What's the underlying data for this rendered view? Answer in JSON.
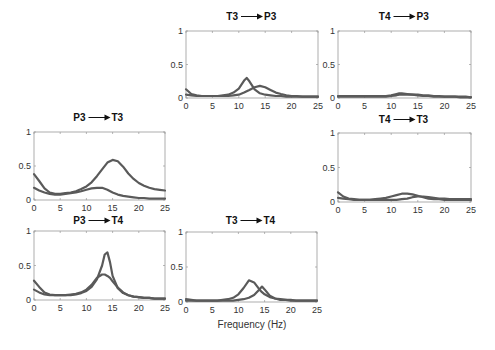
{
  "figure": {
    "xlabel": "Frequency (Hz)",
    "line_color": "#5a5a5a",
    "axis_color": "#9a9a9a"
  },
  "chart_data": [
    {
      "type": "line",
      "title": "T3 → P3",
      "title_from": "T3",
      "title_to": "P3",
      "xlabel": "",
      "ylabel": "",
      "xlim": [
        0,
        25
      ],
      "ylim": [
        0,
        1
      ],
      "xticks": [
        0,
        5,
        10,
        15,
        20,
        25
      ],
      "yticks": [
        0,
        0.5,
        1
      ],
      "x": [
        0,
        1,
        2,
        3,
        4,
        5,
        6,
        7,
        8,
        9,
        10,
        11,
        11.5,
        12,
        13,
        14,
        15,
        16,
        17,
        18,
        19,
        20,
        21,
        22,
        23,
        24,
        25
      ],
      "series": [
        {
          "name": "curve-1",
          "values": [
            0.13,
            0.06,
            0.04,
            0.03,
            0.03,
            0.03,
            0.03,
            0.04,
            0.05,
            0.08,
            0.14,
            0.26,
            0.3,
            0.25,
            0.13,
            0.07,
            0.05,
            0.04,
            0.03,
            0.03,
            0.02,
            0.02,
            0.02,
            0.02,
            0.02,
            0.02,
            0.02
          ]
        },
        {
          "name": "curve-2",
          "values": [
            0.05,
            0.04,
            0.03,
            0.03,
            0.03,
            0.03,
            0.03,
            0.03,
            0.03,
            0.04,
            0.05,
            0.08,
            0.1,
            0.12,
            0.16,
            0.18,
            0.16,
            0.12,
            0.08,
            0.06,
            0.04,
            0.03,
            0.03,
            0.02,
            0.02,
            0.02,
            0.02
          ]
        }
      ]
    },
    {
      "type": "line",
      "title": "T4 → P3",
      "title_from": "T4",
      "title_to": "P3",
      "xlabel": "",
      "ylabel": "",
      "xlim": [
        0,
        25
      ],
      "ylim": [
        0,
        1
      ],
      "xticks": [
        0,
        5,
        10,
        15,
        20,
        25
      ],
      "yticks": [
        0,
        0.5,
        1
      ],
      "x": [
        0,
        1,
        2,
        3,
        4,
        5,
        6,
        7,
        8,
        9,
        10,
        11,
        11.5,
        12,
        13,
        14,
        15,
        16,
        17,
        18,
        19,
        20,
        21,
        22,
        23,
        24,
        25
      ],
      "series": [
        {
          "name": "curve-1",
          "values": [
            0.03,
            0.03,
            0.03,
            0.03,
            0.03,
            0.03,
            0.03,
            0.03,
            0.03,
            0.03,
            0.04,
            0.06,
            0.07,
            0.07,
            0.06,
            0.05,
            0.04,
            0.03,
            0.03,
            0.02,
            0.02,
            0.02,
            0.02,
            0.02,
            0.01,
            0.01,
            0.01
          ]
        },
        {
          "name": "curve-2",
          "values": [
            0.02,
            0.02,
            0.02,
            0.02,
            0.02,
            0.02,
            0.02,
            0.02,
            0.02,
            0.02,
            0.03,
            0.04,
            0.05,
            0.05,
            0.05,
            0.05,
            0.05,
            0.04,
            0.04,
            0.03,
            0.03,
            0.02,
            0.02,
            0.02,
            0.02,
            0.02,
            0.01
          ]
        }
      ]
    },
    {
      "type": "line",
      "title": "P3 → T3",
      "title_from": "P3",
      "title_to": "T3",
      "xlabel": "",
      "ylabel": "",
      "xlim": [
        0,
        25
      ],
      "ylim": [
        0,
        1
      ],
      "xticks": [
        0,
        5,
        10,
        15,
        20,
        25
      ],
      "yticks": [
        0,
        0.5,
        1
      ],
      "x": [
        0,
        1,
        2,
        3,
        4,
        5,
        6,
        7,
        8,
        9,
        10,
        11,
        12,
        13,
        14,
        15,
        16,
        17,
        18,
        19,
        20,
        21,
        22,
        23,
        24,
        25
      ],
      "series": [
        {
          "name": "curve-1",
          "values": [
            0.38,
            0.28,
            0.17,
            0.11,
            0.09,
            0.09,
            0.1,
            0.11,
            0.13,
            0.16,
            0.2,
            0.26,
            0.35,
            0.45,
            0.55,
            0.59,
            0.57,
            0.49,
            0.39,
            0.31,
            0.25,
            0.21,
            0.18,
            0.16,
            0.15,
            0.14
          ]
        },
        {
          "name": "curve-2",
          "values": [
            0.18,
            0.14,
            0.11,
            0.09,
            0.08,
            0.08,
            0.09,
            0.1,
            0.11,
            0.13,
            0.15,
            0.17,
            0.18,
            0.18,
            0.15,
            0.11,
            0.08,
            0.06,
            0.05,
            0.04,
            0.03,
            0.03,
            0.02,
            0.02,
            0.02,
            0.02
          ]
        }
      ]
    },
    {
      "type": "line",
      "title": "T4 → T3",
      "title_from": "T4",
      "title_to": "T3",
      "xlabel": "",
      "ylabel": "",
      "xlim": [
        0,
        25
      ],
      "ylim": [
        0,
        1
      ],
      "xticks": [
        0,
        5,
        10,
        15,
        20,
        25
      ],
      "yticks": [
        0,
        0.5,
        1
      ],
      "x": [
        0,
        1,
        2,
        3,
        4,
        5,
        6,
        7,
        8,
        9,
        10,
        11,
        12,
        13,
        14,
        15,
        16,
        17,
        18,
        19,
        20,
        21,
        22,
        23,
        24,
        25
      ],
      "series": [
        {
          "name": "curve-1",
          "values": [
            0.14,
            0.08,
            0.05,
            0.04,
            0.03,
            0.03,
            0.03,
            0.04,
            0.05,
            0.06,
            0.08,
            0.1,
            0.12,
            0.12,
            0.11,
            0.09,
            0.07,
            0.05,
            0.04,
            0.04,
            0.03,
            0.03,
            0.03,
            0.03,
            0.03,
            0.03
          ]
        },
        {
          "name": "curve-2",
          "values": [
            0.06,
            0.05,
            0.04,
            0.03,
            0.03,
            0.03,
            0.03,
            0.03,
            0.03,
            0.03,
            0.03,
            0.03,
            0.04,
            0.05,
            0.07,
            0.08,
            0.08,
            0.07,
            0.06,
            0.05,
            0.05,
            0.04,
            0.04,
            0.04,
            0.04,
            0.04
          ]
        }
      ]
    },
    {
      "type": "line",
      "title": "P3 → T4",
      "title_from": "P3",
      "title_to": "T4",
      "xlabel": "",
      "ylabel": "",
      "xlim": [
        0,
        25
      ],
      "ylim": [
        0,
        1
      ],
      "xticks": [
        0,
        5,
        10,
        15,
        20,
        25
      ],
      "yticks": [
        0,
        0.5,
        1
      ],
      "x": [
        0,
        1,
        2,
        3,
        4,
        5,
        6,
        7,
        8,
        9,
        10,
        11,
        12,
        13,
        13.5,
        14,
        14.5,
        15,
        16,
        17,
        18,
        19,
        20,
        21,
        22,
        23,
        24,
        25
      ],
      "series": [
        {
          "name": "curve-1",
          "values": [
            0.28,
            0.19,
            0.11,
            0.08,
            0.07,
            0.07,
            0.07,
            0.07,
            0.08,
            0.1,
            0.13,
            0.19,
            0.3,
            0.5,
            0.66,
            0.69,
            0.55,
            0.35,
            0.17,
            0.1,
            0.07,
            0.05,
            0.04,
            0.03,
            0.03,
            0.02,
            0.02,
            0.02
          ]
        },
        {
          "name": "curve-2",
          "values": [
            0.15,
            0.11,
            0.08,
            0.07,
            0.07,
            0.07,
            0.07,
            0.08,
            0.09,
            0.11,
            0.15,
            0.22,
            0.32,
            0.37,
            0.37,
            0.35,
            0.32,
            0.27,
            0.18,
            0.11,
            0.07,
            0.05,
            0.04,
            0.03,
            0.03,
            0.02,
            0.02,
            0.02
          ]
        }
      ]
    },
    {
      "type": "line",
      "title": "T3 → T4",
      "title_from": "T3",
      "title_to": "T4",
      "xlabel": "Frequency (Hz)",
      "ylabel": "",
      "xlim": [
        0,
        25
      ],
      "ylim": [
        0,
        1
      ],
      "xticks": [
        0,
        5,
        10,
        15,
        20,
        25
      ],
      "yticks": [
        0,
        0.5,
        1
      ],
      "x": [
        0,
        1,
        2,
        3,
        4,
        5,
        6,
        7,
        8,
        9,
        10,
        11,
        12,
        13,
        14,
        14.5,
        15,
        16,
        17,
        18,
        19,
        20,
        21,
        22,
        23,
        24,
        25
      ],
      "series": [
        {
          "name": "curve-1",
          "values": [
            0.04,
            0.03,
            0.02,
            0.02,
            0.02,
            0.02,
            0.02,
            0.03,
            0.04,
            0.06,
            0.11,
            0.2,
            0.31,
            0.28,
            0.18,
            0.14,
            0.11,
            0.07,
            0.05,
            0.04,
            0.03,
            0.03,
            0.02,
            0.02,
            0.02,
            0.02,
            0.02
          ]
        },
        {
          "name": "curve-2",
          "values": [
            0.02,
            0.02,
            0.02,
            0.02,
            0.02,
            0.02,
            0.02,
            0.02,
            0.02,
            0.02,
            0.03,
            0.04,
            0.06,
            0.1,
            0.18,
            0.22,
            0.18,
            0.09,
            0.05,
            0.03,
            0.03,
            0.02,
            0.02,
            0.02,
            0.02,
            0.02,
            0.02
          ]
        }
      ]
    }
  ],
  "layout": {
    "panels": [
      {
        "x0": 186,
        "x1": 318,
        "y1": 31,
        "y0": 98,
        "title_y": 20
      },
      {
        "x0": 338,
        "x1": 471,
        "y1": 31,
        "y0": 98,
        "title_y": 20
      },
      {
        "x0": 34,
        "x1": 165,
        "y1": 132,
        "y0": 200,
        "title_y": 121
      },
      {
        "x0": 338,
        "x1": 471,
        "y1": 133,
        "y0": 202,
        "title_y": 123
      },
      {
        "x0": 34,
        "x1": 165,
        "y1": 231,
        "y0": 300,
        "title_y": 224
      },
      {
        "x0": 186,
        "x1": 317,
        "y1": 232,
        "y0": 302,
        "title_y": 224
      }
    ]
  }
}
